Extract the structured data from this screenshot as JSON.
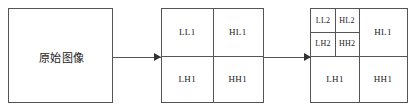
{
  "diagram": {
    "stroke_color": "#555555",
    "text_color": "#1a1a1a",
    "background": "#ffffff"
  },
  "original": {
    "label": "原始图像"
  },
  "arrows": {
    "first": "arrow-right",
    "second": "arrow-right"
  },
  "level1": {
    "cells": [
      {
        "key": "ll1",
        "label": "LL1"
      },
      {
        "key": "hl1",
        "label": "HL1"
      },
      {
        "key": "lh1",
        "label": "LH1"
      },
      {
        "key": "hh1",
        "label": "HH1"
      }
    ]
  },
  "level2": {
    "sub_cells": [
      {
        "key": "ll2",
        "label": "LL2"
      },
      {
        "key": "hl2",
        "label": "HL2"
      },
      {
        "key": "lh2",
        "label": "LH2"
      },
      {
        "key": "hh2",
        "label": "HH2"
      }
    ],
    "cells": [
      {
        "key": "hl1",
        "label": "HL1"
      },
      {
        "key": "lh1",
        "label": "LH1"
      },
      {
        "key": "hh1",
        "label": "HH1"
      }
    ]
  }
}
